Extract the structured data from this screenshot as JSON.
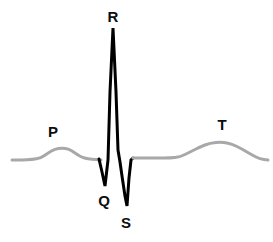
{
  "figure": {
    "background_color": "#ffffff",
    "width": 273,
    "height": 242
  },
  "style": {
    "baseline_color": "#a8a8a8",
    "qrs_color": "#000000",
    "label_color": "#0d0d0d",
    "baseline_stroke_width": 3,
    "qrs_stroke_width": 3
  },
  "labels": [
    {
      "id": "p",
      "text": "P",
      "x": 53,
      "y": 131
    },
    {
      "id": "q",
      "text": "Q",
      "x": 104,
      "y": 200
    },
    {
      "id": "r",
      "text": "R",
      "x": 113,
      "y": 16
    },
    {
      "id": "s",
      "text": "S",
      "x": 126,
      "y": 222
    },
    {
      "id": "t",
      "text": "T",
      "x": 222,
      "y": 124
    }
  ],
  "chart_data": {
    "type": "line",
    "xlabel": "",
    "ylabel": "",
    "grid": false,
    "legend": "none",
    "annotations": [
      "P",
      "Q",
      "R",
      "S",
      "T"
    ],
    "baseline_y": 158,
    "series": [
      {
        "name": "baseline-p-segment",
        "color": "#a8a8a8",
        "points": [
          [
            12,
            160
          ],
          [
            22,
            160
          ],
          [
            32,
            159.5
          ],
          [
            41,
            158
          ],
          [
            48,
            153
          ],
          [
            55,
            149
          ],
          [
            62,
            148
          ],
          [
            69,
            149
          ],
          [
            75,
            153
          ],
          [
            81,
            157
          ],
          [
            88,
            159
          ],
          [
            96,
            159.5
          ],
          [
            101,
            160
          ]
        ]
      },
      {
        "name": "qrs-complex",
        "color": "#000000",
        "points": [
          [
            99,
            159
          ],
          [
            102,
            172
          ],
          [
            105,
            186
          ],
          [
            108,
            160
          ],
          [
            110,
            92
          ],
          [
            113,
            28
          ],
          [
            116,
            92
          ],
          [
            118,
            150
          ],
          [
            120,
            162
          ],
          [
            122,
            176
          ],
          [
            125,
            196
          ],
          [
            127,
            206
          ],
          [
            129,
            178
          ],
          [
            131,
            160
          ],
          [
            133,
            158
          ]
        ]
      },
      {
        "name": "st-t-segment",
        "color": "#a8a8a8",
        "points": [
          [
            133,
            158
          ],
          [
            145,
            158
          ],
          [
            158,
            158
          ],
          [
            170,
            158
          ],
          [
            180,
            157
          ],
          [
            190,
            152
          ],
          [
            200,
            147
          ],
          [
            210,
            143
          ],
          [
            222,
            142
          ],
          [
            232,
            144
          ],
          [
            242,
            149
          ],
          [
            252,
            155
          ],
          [
            260,
            159
          ],
          [
            268,
            160
          ]
        ]
      }
    ]
  }
}
